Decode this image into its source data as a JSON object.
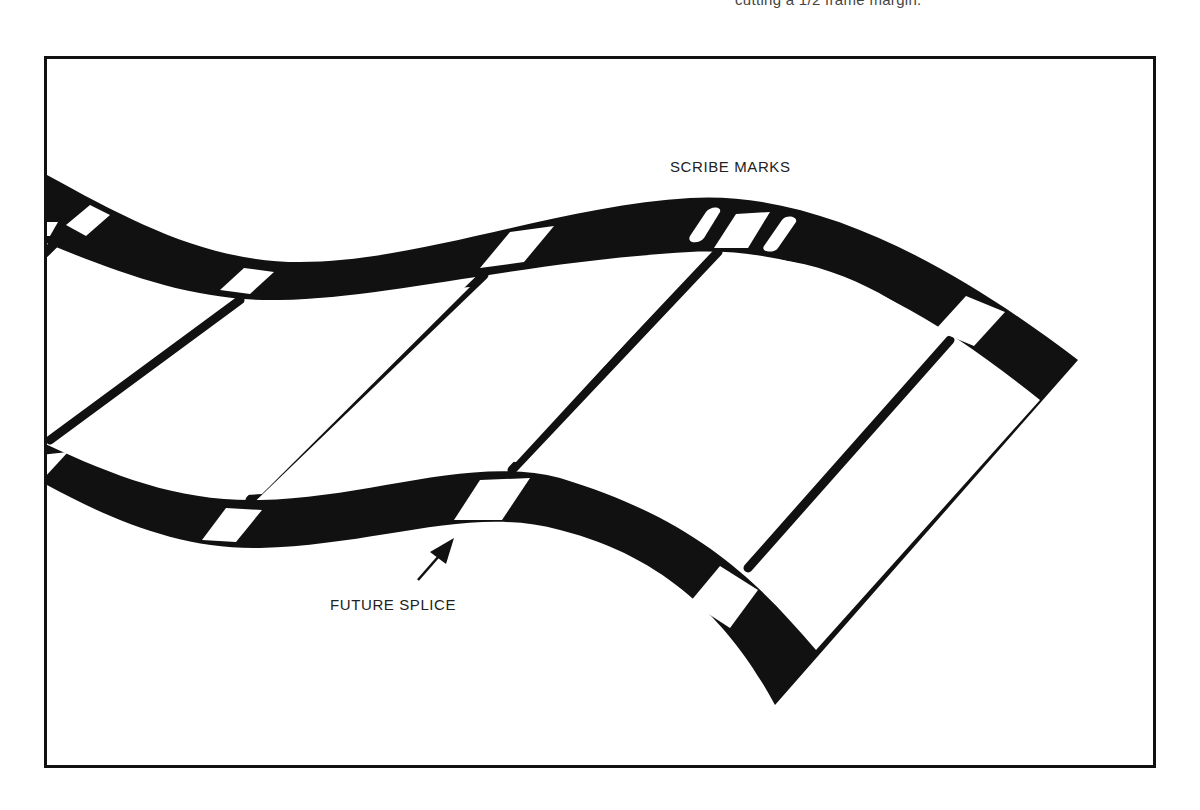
{
  "figure": {
    "caption_fragment": "cutting a 1/2 frame margin.",
    "labels": {
      "scribe_marks": "SCRIBE MARKS",
      "future_splice": "FUTURE SPLICE"
    },
    "elements": {
      "film_strip": "curved-film-strip",
      "frames": 5,
      "scribe_marks_count": 3
    },
    "colors": {
      "ink": "#111111",
      "paper": "#ffffff",
      "caption_text": "#444444"
    }
  }
}
